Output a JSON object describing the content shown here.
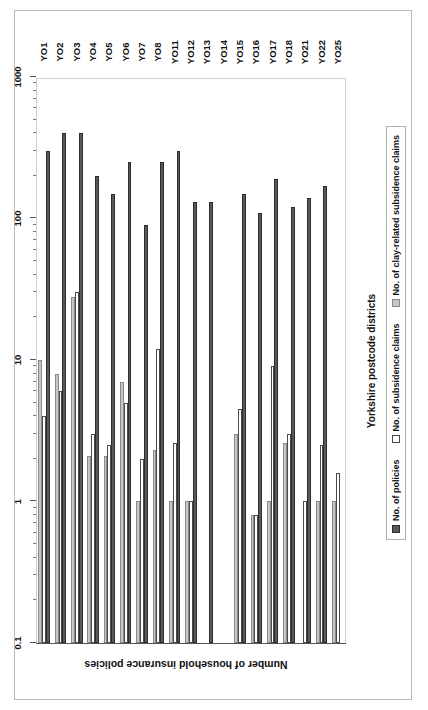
{
  "figure": {
    "frame_color": "#b9b9b9",
    "background": "#ffffff"
  },
  "chart_data": {
    "type": "bar",
    "orientation": "horizontal-rotated",
    "title": "",
    "xlabel": "Yorkshire postcode districts",
    "ylabel": "Number of household insurance policies",
    "yscale": "log",
    "ylim": [
      0.1,
      1000
    ],
    "ytick_labels": [
      "1000",
      "100",
      "10",
      "1",
      "0.1"
    ],
    "ytick_values": [
      1000,
      100,
      10,
      1,
      0.1
    ],
    "grid": false,
    "legend_position": "bottom-center",
    "categories": [
      "YO1",
      "YO2",
      "YO3",
      "YO4",
      "YO5",
      "YO6",
      "YO7",
      "YO8",
      "YO11",
      "YO12",
      "YO13",
      "YO14",
      "YO15",
      "YO16",
      "YO17",
      "YO18",
      "YO21",
      "YO22",
      "YO25"
    ],
    "series": [
      {
        "name": "No. of policies",
        "key": "policies",
        "color": "#595959",
        "values": [
          300,
          400,
          400,
          200,
          150,
          250,
          90,
          250,
          300,
          130,
          130,
          0,
          150,
          110,
          190,
          120,
          140,
          170,
          0
        ]
      },
      {
        "name": "No. of subsidence claims",
        "key": "subsidence",
        "color": "#ffffff",
        "values": [
          4,
          6,
          30,
          3,
          2.5,
          5,
          2,
          12,
          2.6,
          1,
          0,
          0,
          4.5,
          0.8,
          9,
          3,
          1,
          2.5,
          1.6
        ]
      },
      {
        "name": "No. of clay-related subsidence claims",
        "key": "clay",
        "color": "#c6c6c6",
        "values": [
          10,
          8,
          28,
          2.1,
          2.1,
          7,
          1,
          2.3,
          1,
          1,
          0,
          0,
          3,
          0.8,
          1,
          2.6,
          0,
          1,
          1
        ]
      }
    ]
  },
  "legend": {
    "items": [
      {
        "label": "No. of policies",
        "swatch": "dark-gray-swatch"
      },
      {
        "label": "No. of subsidence claims",
        "swatch": "white-swatch"
      },
      {
        "label": "No. of clay-related subsidence claims",
        "swatch": "light-gray-swatch"
      }
    ]
  }
}
